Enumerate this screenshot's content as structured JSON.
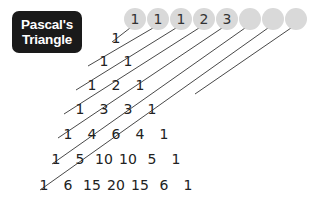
{
  "title": {
    "line1": "Pascal's",
    "line2": "Triangle"
  },
  "circles": [
    {
      "label": "1",
      "cx": 135
    },
    {
      "label": "1",
      "cx": 158
    },
    {
      "label": "1",
      "cx": 181
    },
    {
      "label": "2",
      "cx": 204
    },
    {
      "label": "3",
      "cx": 227
    },
    {
      "label": "",
      "cx": 250
    },
    {
      "label": "",
      "cx": 273
    },
    {
      "label": "",
      "cx": 296
    }
  ],
  "rows": [
    {
      "y": 38,
      "values": [
        "1"
      ]
    },
    {
      "y": 61,
      "values": [
        "1",
        "1"
      ]
    },
    {
      "y": 85,
      "values": [
        "1",
        "2",
        "1"
      ]
    },
    {
      "y": 109,
      "values": [
        "1",
        "3",
        "3",
        "1"
      ]
    },
    {
      "y": 134,
      "values": [
        "1",
        "4",
        "6",
        "4",
        "1"
      ]
    },
    {
      "y": 159,
      "values": [
        "1",
        "5",
        "10",
        "10",
        "5",
        "1"
      ]
    },
    {
      "y": 185,
      "values": [
        "1",
        "6",
        "15",
        "20",
        "15",
        "6",
        "1"
      ]
    }
  ],
  "colors": {
    "title_bg": "#1a1a1a",
    "circle_fill": "#d9d9d9",
    "line": "#333333"
  }
}
